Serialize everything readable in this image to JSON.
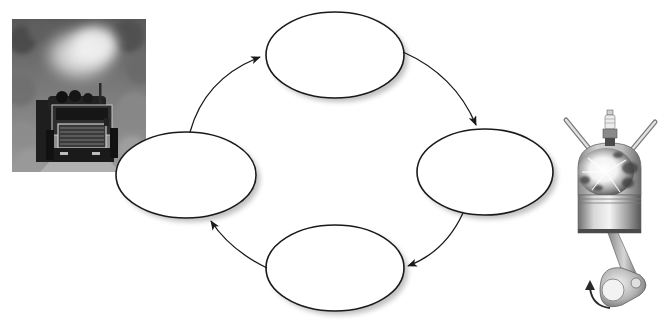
{
  "diagram": {
    "type": "cycle",
    "title": "",
    "direction": "clockwise",
    "colors": {
      "background": "#ffffff",
      "ellipse_stroke": "#1a1a1a",
      "ellipse_fill": "#ffffff",
      "shadow": "#9a9a9a",
      "arrow": "#1a1a1a"
    },
    "nodes": [
      {
        "id": "top",
        "label": "",
        "cx": 335,
        "cy": 55,
        "rx": 69,
        "ry": 43
      },
      {
        "id": "right",
        "label": "",
        "cx": 485,
        "cy": 172,
        "rx": 68,
        "ry": 43
      },
      {
        "id": "bottom",
        "label": "",
        "cx": 335,
        "cy": 268,
        "rx": 69,
        "ry": 43
      },
      {
        "id": "left",
        "label": "",
        "cx": 186,
        "cy": 175,
        "rx": 70,
        "ry": 43
      }
    ],
    "edges": [
      {
        "from": "left",
        "to": "top"
      },
      {
        "from": "top",
        "to": "right"
      },
      {
        "from": "right",
        "to": "bottom"
      },
      {
        "from": "bottom",
        "to": "left"
      }
    ],
    "images": [
      {
        "id": "logging-truck-photo",
        "description": "Black-and-white photo of a logging truck emitting exhaust smoke on a forest road"
      },
      {
        "id": "engine-cylinder-illustration",
        "description": "Illustration of an internal combustion engine cylinder with spark plug, valves, combustion explosion, piston, connecting rod and rotating crankshaft"
      }
    ]
  }
}
